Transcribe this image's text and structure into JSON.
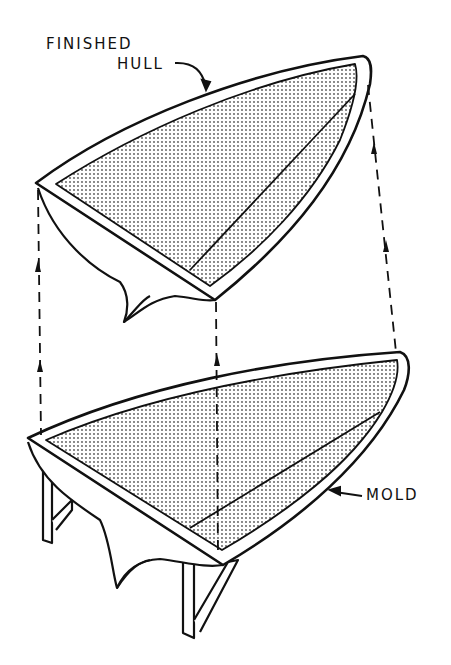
{
  "diagram": {
    "labels": {
      "finished_hull_line1": "FINISHED",
      "finished_hull_line2": "HULL",
      "mold": "MOLD"
    },
    "colors": {
      "ink": "#111111",
      "shade": "#c8c8c8",
      "background": "#ffffff"
    }
  }
}
